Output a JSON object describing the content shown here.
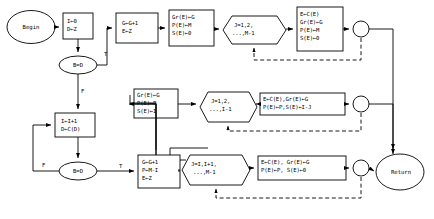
{
  "diagram": {
    "stroke_color": "#000000",
    "fill_color": "#ffffff",
    "nodes": {
      "begin": {
        "label": "Begin",
        "shape": "ellipse"
      },
      "init": {
        "line1": "I←0",
        "line2": "D←Z",
        "shape": "rect"
      },
      "decision1": {
        "label": "B=D",
        "shape": "ellipse"
      },
      "incr": {
        "line1": "I←I+1",
        "line2": "D←C(D)",
        "shape": "rect"
      },
      "decision2": {
        "label": "B=D",
        "shape": "ellipse"
      },
      "g_top": {
        "line1": "G←G+1",
        "line2": "E←Z",
        "shape": "rect"
      },
      "gr_top": {
        "line1": "Gr(E)←G",
        "line2": "P(E)←M",
        "line3": "S(E)←0",
        "shape": "rect"
      },
      "loop_top": {
        "line1": "J=1,2,",
        "line2": "...,M-1",
        "shape": "hexagon"
      },
      "body_top": {
        "line1": "E←C(E)",
        "line2": "Gr(E)←G",
        "line3": "P(E)←M",
        "line4": "S(E)←0",
        "shape": "rect"
      },
      "gr_mid": {
        "line1": "Gr(E)←G",
        "line2": "P(E)←P",
        "line3": "S(E)←I",
        "shape": "rect"
      },
      "loop_mid": {
        "line1": "J=1,2,",
        "line2": "...,I-1",
        "shape": "hexagon"
      },
      "body_mid": {
        "line1": "E←C(E),Gr(E)←G",
        "line2": "P(E)←P,S(E)←I-J",
        "shape": "rect"
      },
      "g_bot": {
        "line1": "G←G+1",
        "line2": "P←M-I",
        "line3": "E←Z",
        "shape": "rect"
      },
      "loop_bot": {
        "line1": "J=I,I+1,",
        "line2": "...,M-1",
        "shape": "hexagon"
      },
      "body_bot": {
        "line1": "E←C(E), Gr(E)←G",
        "line2": "P(E)←P, S(E)←0",
        "shape": "rect"
      },
      "return": {
        "label": "Return",
        "shape": "ellipse"
      },
      "junction_top": {
        "label": "",
        "shape": "circle"
      },
      "junction_mid": {
        "label": "",
        "shape": "circle"
      },
      "junction_bot": {
        "label": "",
        "shape": "circle"
      }
    },
    "edge_labels": {
      "d1_true": "T",
      "d1_false": "F",
      "d2_true": "T",
      "d2_false": "F"
    }
  }
}
